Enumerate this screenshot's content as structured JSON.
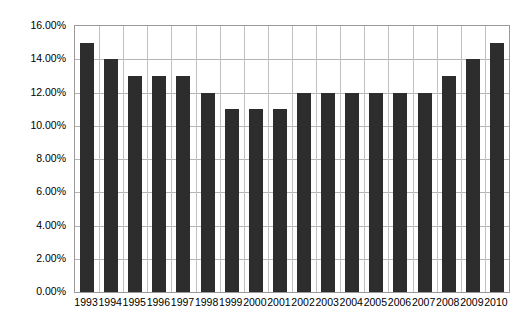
{
  "chart_data": {
    "type": "bar",
    "title": "",
    "subtitle": "",
    "xlabel": "",
    "ylabel": "",
    "categories": [
      "1993",
      "1994",
      "1995",
      "1996",
      "1997",
      "1998",
      "1999",
      "2000",
      "2001",
      "2002",
      "2003",
      "2004",
      "2005",
      "2006",
      "2007",
      "2008",
      "2009",
      "2010"
    ],
    "values": [
      15.0,
      14.0,
      13.0,
      13.0,
      13.0,
      12.0,
      11.0,
      11.0,
      11.0,
      12.0,
      12.0,
      12.0,
      12.0,
      12.0,
      12.0,
      13.0,
      14.0,
      15.0
    ],
    "value_unit": "%",
    "ylim": [
      0,
      16
    ],
    "ytick_values": [
      0,
      2,
      4,
      6,
      8,
      10,
      12,
      14,
      16
    ],
    "ytick_labels": [
      "0.00%",
      "2.00%",
      "4.00%",
      "6.00%",
      "8.00%",
      "10.00%",
      "12.00%",
      "14.00%",
      "16.00%"
    ],
    "grid": "both",
    "legend": "none",
    "bar_color": "#2d2d2d",
    "gridline_color": "#b4b4b4",
    "axis_border_color": "#9a9a9a",
    "background_color": "#ffffff",
    "annotations": []
  }
}
